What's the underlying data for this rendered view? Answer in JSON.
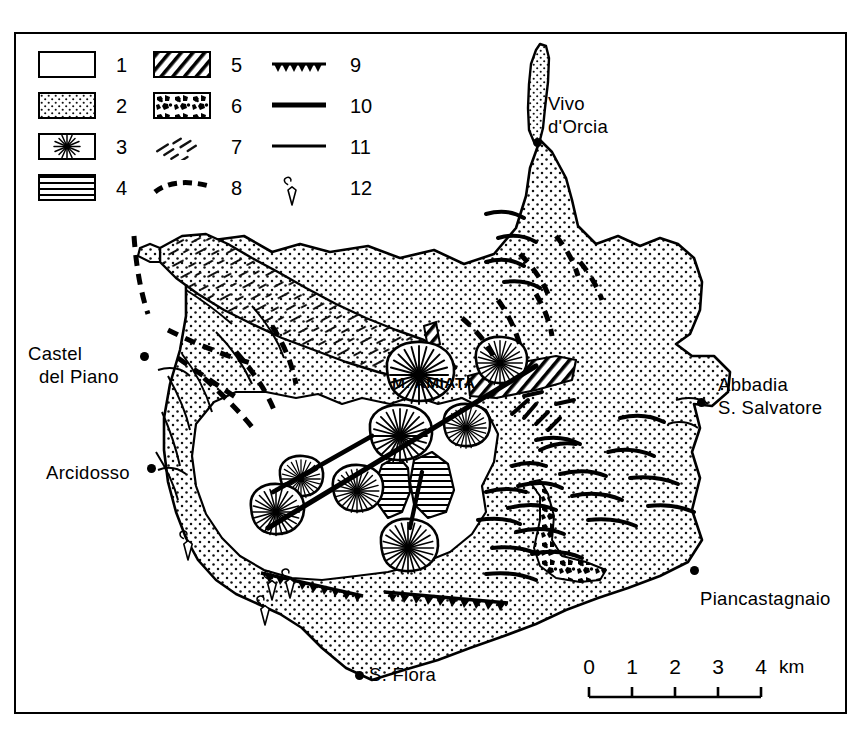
{
  "figure": {
    "kind": "geological-sketch-map",
    "region": "Monte Amiata"
  },
  "legend": {
    "columns": [
      {
        "items": [
          {
            "num": "1",
            "symbol": "blank-box"
          },
          {
            "num": "2",
            "symbol": "stippled-box"
          },
          {
            "num": "3",
            "symbol": "radial-starburst-box"
          },
          {
            "num": "4",
            "symbol": "horizontal-lines-box"
          }
        ]
      },
      {
        "items": [
          {
            "num": "5",
            "symbol": "diagonal-hatch-box"
          },
          {
            "num": "6",
            "symbol": "breccia-clast-box"
          },
          {
            "num": "7",
            "symbol": "scattered-diagonal-dashes"
          },
          {
            "num": "8",
            "symbol": "thick-dashed-curve"
          }
        ]
      },
      {
        "items": [
          {
            "num": "9",
            "symbol": "sawtooth-line"
          },
          {
            "num": "10",
            "symbol": "thick-solid-line"
          },
          {
            "num": "11",
            "symbol": "thin-solid-line"
          },
          {
            "num": "12",
            "symbol": "fumarole-symbol"
          }
        ]
      }
    ]
  },
  "places": [
    {
      "name": "Vivo\nd'Orcia",
      "id": "vivo-dorcia"
    },
    {
      "name": "Castel\n  del Piano",
      "id": "castel-del-piano"
    },
    {
      "name": "Arcidosso",
      "id": "arcidosso"
    },
    {
      "name": "Abbadia\nS. Salvatore",
      "id": "abbadia-s-salvatore"
    },
    {
      "name": "Piancastagnaio",
      "id": "piancastagnaio"
    },
    {
      "name": "S. Fiora",
      "id": "s-fiora"
    }
  ],
  "summit": {
    "label": "M. AMIATA"
  },
  "scale": {
    "ticks": [
      "0",
      "1",
      "2",
      "3",
      "4"
    ],
    "unit": "km"
  }
}
